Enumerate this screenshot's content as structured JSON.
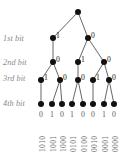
{
  "figure": {
    "background_color": "#ffffff",
    "node_color": "#111111",
    "edge_color": "#555555",
    "label_color": "#8a8a8a"
  },
  "level_labels": [
    {
      "text": "1st bit",
      "x": 3,
      "y": 34
    },
    {
      "text": "2nd bit",
      "x": 3,
      "y": 58
    },
    {
      "text": "3rd bit",
      "x": 3,
      "y": 74
    },
    {
      "text": "4th bit",
      "x": 3,
      "y": 99
    }
  ],
  "nodes": [
    {
      "id": "root",
      "x": 78,
      "y": 12,
      "r": 3.0,
      "bit": "",
      "bit_dx": 3,
      "bit_dy": -7
    },
    {
      "id": "n1a",
      "x": 53,
      "y": 38,
      "r": 3.0,
      "bit": "1",
      "bit_dx": 3,
      "bit_dy": -7
    },
    {
      "id": "n1b",
      "x": 88,
      "y": 38,
      "r": 3.0,
      "bit": "0",
      "bit_dx": 3,
      "bit_dy": -7
    },
    {
      "id": "n2a",
      "x": 53,
      "y": 62,
      "r": 3.0,
      "bit": "0",
      "bit_dx": 3,
      "bit_dy": -7
    },
    {
      "id": "n2b",
      "x": 78,
      "y": 62,
      "r": 3.0,
      "bit": "1",
      "bit_dx": 3,
      "bit_dy": -7
    },
    {
      "id": "n2c",
      "x": 104,
      "y": 62,
      "r": 3.0,
      "bit": "0",
      "bit_dx": 3,
      "bit_dy": -7
    },
    {
      "id": "n3a",
      "x": 41,
      "y": 80,
      "r": 3.0,
      "bit": "1",
      "bit_dx": 3,
      "bit_dy": -7
    },
    {
      "id": "n3b",
      "x": 60,
      "y": 80,
      "r": 3.0,
      "bit": "0",
      "bit_dx": 3,
      "bit_dy": -7
    },
    {
      "id": "n3c",
      "x": 78,
      "y": 80,
      "r": 3.0,
      "bit": "0",
      "bit_dx": 3,
      "bit_dy": -7
    },
    {
      "id": "n3d",
      "x": 93,
      "y": 80,
      "r": 3.0,
      "bit": "1",
      "bit_dx": 3,
      "bit_dy": -7
    },
    {
      "id": "n3e",
      "x": 109,
      "y": 80,
      "r": 3.0,
      "bit": "0",
      "bit_dx": 3,
      "bit_dy": -7
    },
    {
      "id": "l0",
      "x": 41,
      "y": 104,
      "r": 3.0,
      "bit": "",
      "bit_dx": 0,
      "bit_dy": 0
    },
    {
      "id": "l1",
      "x": 52,
      "y": 104,
      "r": 3.0,
      "bit": "",
      "bit_dx": 0,
      "bit_dy": 0
    },
    {
      "id": "l2",
      "x": 62,
      "y": 104,
      "r": 3.0,
      "bit": "",
      "bit_dx": 0,
      "bit_dy": 0
    },
    {
      "id": "l3",
      "x": 72,
      "y": 104,
      "r": 3.0,
      "bit": "",
      "bit_dx": 0,
      "bit_dy": 0
    },
    {
      "id": "l4",
      "x": 83,
      "y": 104,
      "r": 3.0,
      "bit": "",
      "bit_dx": 0,
      "bit_dy": 0
    },
    {
      "id": "l5",
      "x": 93,
      "y": 104,
      "r": 3.0,
      "bit": "",
      "bit_dx": 0,
      "bit_dy": 0
    },
    {
      "id": "l6",
      "x": 104,
      "y": 104,
      "r": 3.0,
      "bit": "",
      "bit_dx": 0,
      "bit_dy": 0
    },
    {
      "id": "l7",
      "x": 114,
      "y": 104,
      "r": 3.0,
      "bit": "",
      "bit_dx": 0,
      "bit_dy": 0
    }
  ],
  "edges": [
    {
      "from": "root",
      "to": "n1a"
    },
    {
      "from": "root",
      "to": "n1b"
    },
    {
      "from": "n1a",
      "to": "n2a"
    },
    {
      "from": "n1b",
      "to": "n2b"
    },
    {
      "from": "n1b",
      "to": "n2c"
    },
    {
      "from": "n2a",
      "to": "n3a"
    },
    {
      "from": "n2a",
      "to": "n3b"
    },
    {
      "from": "n2b",
      "to": "n3c"
    },
    {
      "from": "n2c",
      "to": "n3d"
    },
    {
      "from": "n2c",
      "to": "n3e"
    },
    {
      "from": "n3a",
      "to": "l0"
    },
    {
      "from": "n3b",
      "to": "l1"
    },
    {
      "from": "n3b",
      "to": "l2"
    },
    {
      "from": "n3c",
      "to": "l3"
    },
    {
      "from": "n3c",
      "to": "l4"
    },
    {
      "from": "n3d",
      "to": "l5"
    },
    {
      "from": "n3e",
      "to": "l6"
    },
    {
      "from": "n3e",
      "to": "l7"
    }
  ],
  "leaf_bits": [
    {
      "text": "0",
      "x": 41,
      "y": 110
    },
    {
      "text": "1",
      "x": 52,
      "y": 110
    },
    {
      "text": "0",
      "x": 62,
      "y": 110
    },
    {
      "text": "1",
      "x": 72,
      "y": 110
    },
    {
      "text": "0",
      "x": 83,
      "y": 110
    },
    {
      "text": "0",
      "x": 93,
      "y": 110
    },
    {
      "text": "1",
      "x": 104,
      "y": 110
    },
    {
      "text": "0",
      "x": 114,
      "y": 110
    }
  ],
  "leaf_codes": [
    {
      "text": "1010",
      "x": 41,
      "y": 152
    },
    {
      "text": "1001",
      "x": 52,
      "y": 152
    },
    {
      "text": "1000",
      "x": 62,
      "y": 152
    },
    {
      "text": "0101",
      "x": 72,
      "y": 152
    },
    {
      "text": "0100",
      "x": 83,
      "y": 152
    },
    {
      "text": "0010",
      "x": 93,
      "y": 152
    },
    {
      "text": "0001",
      "x": 104,
      "y": 152
    },
    {
      "text": "0000",
      "x": 114,
      "y": 152
    }
  ]
}
